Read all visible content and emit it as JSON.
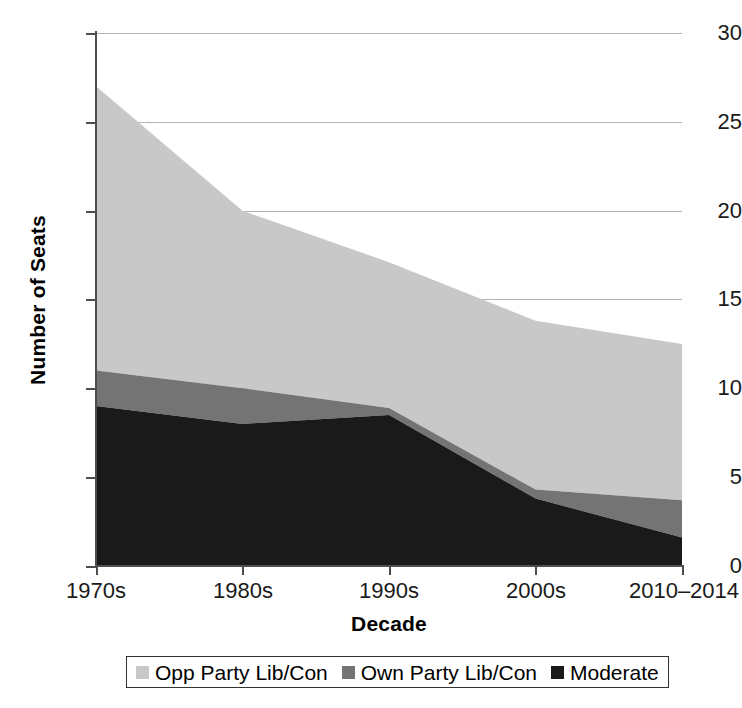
{
  "chart_data": {
    "type": "area",
    "stacked": true,
    "title": "",
    "xlabel": "Decade",
    "ylabel": "Number of Seats",
    "categories": [
      "1970s",
      "1980s",
      "1990s",
      "2000s",
      "2010–2014"
    ],
    "ylim": [
      0,
      30
    ],
    "yticks": [
      0,
      5,
      10,
      15,
      20,
      25,
      30
    ],
    "ytick_labels": [
      "0",
      "5",
      "10",
      "15",
      "20",
      "25",
      "30"
    ],
    "grid": true,
    "grid_axis": "y",
    "legend_position": "bottom",
    "series": [
      {
        "name": "Opp Party Lib/Con",
        "color": "#c8c8c8",
        "stack_order": 3,
        "values": [
          16.0,
          10.0,
          8.2,
          9.5,
          8.8
        ]
      },
      {
        "name": "Own Party Lib/Con",
        "color": "#747474",
        "stack_order": 2,
        "values": [
          2.0,
          2.0,
          0.4,
          0.5,
          2.1
        ]
      },
      {
        "name": "Moderate",
        "color": "#1a1a1a",
        "stack_order": 1,
        "values": [
          9.0,
          8.0,
          8.5,
          3.8,
          1.6
        ]
      }
    ],
    "cumulative_tops": {
      "moderate": [
        9.0,
        8.0,
        8.5,
        3.8,
        1.6
      ],
      "own_party": [
        11.0,
        10.0,
        8.9,
        4.3,
        3.7
      ],
      "opp_party": [
        27.0,
        20.0,
        17.1,
        13.8,
        12.5
      ]
    }
  },
  "axes": {
    "y_title": "Number of Seats",
    "x_title": "Decade",
    "y_ticks": [
      "0",
      "5",
      "10",
      "15",
      "20",
      "25",
      "30"
    ],
    "x_ticks": [
      "1970s",
      "1980s",
      "1990s",
      "2000s",
      "2010–2014"
    ]
  },
  "legend": {
    "items": [
      {
        "label": "Opp Party Lib/Con",
        "color": "#c8c8c8"
      },
      {
        "label": "Own Party Lib/Con",
        "color": "#747474"
      },
      {
        "label": "Moderate",
        "color": "#1a1a1a"
      }
    ]
  },
  "colors": {
    "opp_party": "#c8c8c8",
    "own_party": "#747474",
    "moderate": "#1a1a1a",
    "axis": "#4d4d4d",
    "grid": "#b3b3b3",
    "background": "#ffffff"
  }
}
